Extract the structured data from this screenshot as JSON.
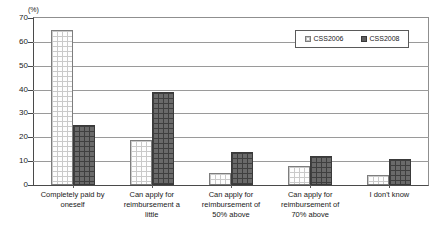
{
  "chart_data": {
    "type": "bar",
    "title": "",
    "xlabel": "",
    "ylabel": "(%)",
    "ylim": [
      0,
      70
    ],
    "ytick_step": 10,
    "yticks": [
      70,
      60,
      50,
      40,
      30,
      20,
      10,
      0
    ],
    "grid": true,
    "legend_position": "top-right",
    "categories": [
      "Completely paid by oneself",
      "Can apply for reimbursement a little",
      "Can apply for reimbursement of 50% above",
      "Can apply for reimbursement of 70% above",
      "I don't know"
    ],
    "category_lines": [
      [
        "Completely paid by",
        "oneself"
      ],
      [
        "Can apply for",
        "reimbursement a",
        "little"
      ],
      [
        "Can apply for",
        "reimbursement of",
        "50% above"
      ],
      [
        "Can apply for",
        "reimbursement of",
        "70% above"
      ],
      [
        "I don't know"
      ]
    ],
    "series": [
      {
        "name": "CSS2006",
        "color": "#fdfdfd",
        "values": [
          65,
          19,
          5,
          8,
          4
        ]
      },
      {
        "name": "CSS2008",
        "color": "#6a6a6a",
        "values": [
          25,
          39,
          14,
          12,
          11
        ]
      }
    ]
  },
  "axis": {
    "unit": "(%)"
  },
  "legend": {
    "entries": [
      {
        "label": "CSS2006"
      },
      {
        "label": "CSS2008"
      }
    ]
  }
}
